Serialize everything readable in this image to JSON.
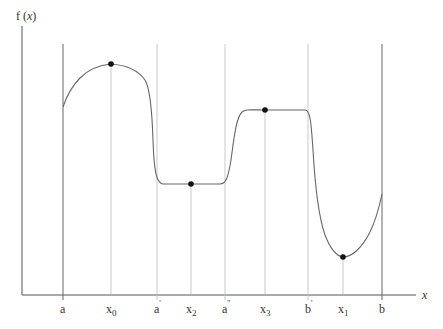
{
  "diagram": {
    "y_axis_label_prefix": "f",
    "y_axis_label_var": "x",
    "x_axis_label": "x",
    "colors": {
      "axis": "#555555",
      "curve": "#666666",
      "guide": "#aaaaaa",
      "point": "#111111",
      "text": "#333333"
    },
    "ticks": [
      {
        "id": "a",
        "base": "a",
        "mark": "",
        "sub": ""
      },
      {
        "id": "x0",
        "base": "x",
        "mark": "",
        "sub": "0"
      },
      {
        "id": "a1",
        "base": "a",
        "mark": "'",
        "sub": ""
      },
      {
        "id": "x2",
        "base": "x",
        "mark": "",
        "sub": "2"
      },
      {
        "id": "a2",
        "base": "a",
        "mark": "''",
        "sub": ""
      },
      {
        "id": "x3",
        "base": "x",
        "mark": "",
        "sub": "3"
      },
      {
        "id": "b1",
        "base": "b",
        "mark": "'",
        "sub": ""
      },
      {
        "id": "x1",
        "base": "x",
        "mark": "",
        "sub": "1"
      },
      {
        "id": "b",
        "base": "b",
        "mark": "",
        "sub": ""
      }
    ],
    "points": [
      {
        "id": "x0",
        "desc": "maximum on [a, a']"
      },
      {
        "id": "x2",
        "desc": "point on constant segment [a', a'']"
      },
      {
        "id": "x3",
        "desc": "point on constant segment near b'"
      },
      {
        "id": "x1",
        "desc": "minimum on [b', b]"
      }
    ]
  }
}
